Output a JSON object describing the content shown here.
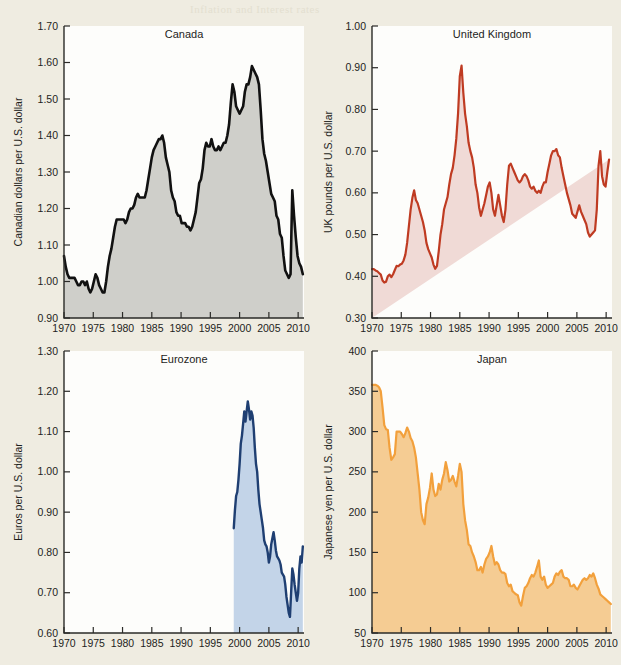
{
  "page": {
    "background_color": "#efece1",
    "bleed_text_top": "Inflation and Interest rates"
  },
  "colors": {
    "canada_line": "#111111",
    "canada_fill": "#cfcfca",
    "uk_line": "#bf3b22",
    "uk_fill": "#f0dad6",
    "eurozone_line": "#1f3f72",
    "eurozone_fill": "#c3d4e8",
    "japan_line": "#f2a03c",
    "japan_fill": "#f5cc93",
    "axis": "#2b2b28",
    "plot_background": "#fdfdfb"
  },
  "chart_data": [
    {
      "type": "area",
      "title": "Canada",
      "xlabel": "",
      "ylabel": "Canadian dollars per U.S. dollar",
      "xlim": [
        1970,
        2011
      ],
      "ylim": [
        0.9,
        1.7
      ],
      "xticks": [
        1970,
        1975,
        1980,
        1985,
        1990,
        1995,
        2000,
        2005,
        2010
      ],
      "yticks": [
        0.9,
        1.0,
        1.1,
        1.2,
        1.3,
        1.4,
        1.5,
        1.6,
        1.7
      ],
      "grid": false,
      "legend": "none",
      "line_color": "#111111",
      "fill_color": "#cfcfca",
      "x": [
        1970.0,
        1970.3,
        1970.6,
        1970.9,
        1971.2,
        1971.5,
        1971.8,
        1972.1,
        1972.4,
        1972.7,
        1973.0,
        1973.3,
        1973.6,
        1973.9,
        1974.2,
        1974.5,
        1974.8,
        1975.1,
        1975.4,
        1975.7,
        1976.0,
        1976.3,
        1976.6,
        1976.9,
        1977.2,
        1977.5,
        1977.8,
        1978.1,
        1978.4,
        1978.7,
        1979.0,
        1979.3,
        1979.6,
        1979.9,
        1980.2,
        1980.5,
        1980.8,
        1981.1,
        1981.4,
        1981.7,
        1982.0,
        1982.3,
        1982.6,
        1982.9,
        1983.2,
        1983.5,
        1983.8,
        1984.1,
        1984.4,
        1984.7,
        1985.0,
        1985.3,
        1985.6,
        1985.9,
        1986.2,
        1986.5,
        1986.8,
        1987.1,
        1987.4,
        1987.7,
        1988.0,
        1988.3,
        1988.6,
        1988.9,
        1989.2,
        1989.5,
        1989.8,
        1990.1,
        1990.4,
        1990.7,
        1991.0,
        1991.3,
        1991.6,
        1991.9,
        1992.2,
        1992.5,
        1992.8,
        1993.1,
        1993.4,
        1993.7,
        1994.0,
        1994.3,
        1994.6,
        1994.9,
        1995.2,
        1995.5,
        1995.8,
        1996.1,
        1996.4,
        1996.7,
        1997.0,
        1997.3,
        1997.6,
        1997.9,
        1998.2,
        1998.5,
        1998.8,
        1999.1,
        1999.4,
        1999.7,
        2000.0,
        2000.3,
        2000.6,
        2000.9,
        2001.2,
        2001.5,
        2001.8,
        2002.1,
        2002.4,
        2002.7,
        2003.0,
        2003.3,
        2003.6,
        2003.9,
        2004.2,
        2004.5,
        2004.8,
        2005.1,
        2005.4,
        2005.7,
        2006.0,
        2006.3,
        2006.6,
        2006.9,
        2007.2,
        2007.5,
        2007.8,
        2008.1,
        2008.4,
        2008.7,
        2009.0,
        2009.3,
        2009.6,
        2009.9,
        2010.2,
        2010.5,
        2010.8
      ],
      "y": [
        1.07,
        1.04,
        1.02,
        1.01,
        1.01,
        1.01,
        1.01,
        1.0,
        0.99,
        0.99,
        1.0,
        1.0,
        0.99,
        1.0,
        0.98,
        0.97,
        0.98,
        1.0,
        1.02,
        1.01,
        0.99,
        0.98,
        0.97,
        0.97,
        1.0,
        1.04,
        1.07,
        1.09,
        1.12,
        1.15,
        1.17,
        1.17,
        1.17,
        1.17,
        1.17,
        1.16,
        1.17,
        1.19,
        1.2,
        1.2,
        1.21,
        1.23,
        1.24,
        1.23,
        1.23,
        1.23,
        1.23,
        1.25,
        1.28,
        1.31,
        1.34,
        1.36,
        1.37,
        1.38,
        1.39,
        1.39,
        1.4,
        1.38,
        1.34,
        1.32,
        1.3,
        1.25,
        1.23,
        1.22,
        1.19,
        1.18,
        1.18,
        1.16,
        1.16,
        1.16,
        1.15,
        1.15,
        1.14,
        1.15,
        1.17,
        1.19,
        1.23,
        1.27,
        1.28,
        1.31,
        1.36,
        1.38,
        1.37,
        1.37,
        1.39,
        1.37,
        1.36,
        1.36,
        1.37,
        1.36,
        1.37,
        1.38,
        1.38,
        1.4,
        1.43,
        1.49,
        1.54,
        1.52,
        1.48,
        1.47,
        1.46,
        1.47,
        1.48,
        1.52,
        1.54,
        1.54,
        1.56,
        1.59,
        1.58,
        1.57,
        1.56,
        1.54,
        1.47,
        1.39,
        1.35,
        1.33,
        1.3,
        1.27,
        1.24,
        1.23,
        1.22,
        1.18,
        1.17,
        1.13,
        1.12,
        1.07,
        1.03,
        1.02,
        1.01,
        1.02,
        1.25,
        1.18,
        1.12,
        1.07,
        1.05,
        1.04,
        1.02
      ]
    },
    {
      "type": "area",
      "title": "United Kingdom",
      "xlabel": "",
      "ylabel": "UK pounds per U.S. dollar",
      "xlim": [
        1970,
        2011
      ],
      "ylim": [
        0.3,
        1.0
      ],
      "xticks": [
        1970,
        1975,
        1980,
        1985,
        1990,
        1995,
        2000,
        2005,
        2010
      ],
      "yticks": [
        0.3,
        0.4,
        0.5,
        0.6,
        0.7,
        0.8,
        0.9,
        1.0
      ],
      "grid": false,
      "legend": "none",
      "line_color": "#bf3b22",
      "fill_color": "#f0dad6",
      "x": [
        1970.0,
        1970.3,
        1970.6,
        1970.9,
        1971.2,
        1971.5,
        1971.8,
        1972.1,
        1972.4,
        1972.7,
        1973.0,
        1973.3,
        1973.6,
        1973.9,
        1974.2,
        1974.5,
        1974.8,
        1975.1,
        1975.4,
        1975.7,
        1976.0,
        1976.3,
        1976.6,
        1976.9,
        1977.2,
        1977.5,
        1977.8,
        1978.1,
        1978.4,
        1978.7,
        1979.0,
        1979.3,
        1979.6,
        1979.9,
        1980.2,
        1980.5,
        1980.8,
        1981.1,
        1981.4,
        1981.7,
        1982.0,
        1982.3,
        1982.6,
        1982.9,
        1983.2,
        1983.5,
        1983.8,
        1984.1,
        1984.4,
        1984.7,
        1985.0,
        1985.3,
        1985.6,
        1985.9,
        1986.2,
        1986.5,
        1986.8,
        1987.1,
        1987.4,
        1987.7,
        1988.0,
        1988.3,
        1988.6,
        1988.9,
        1989.2,
        1989.5,
        1989.8,
        1990.1,
        1990.4,
        1990.7,
        1991.0,
        1991.3,
        1991.6,
        1991.9,
        1992.2,
        1992.5,
        1992.8,
        1993.1,
        1993.4,
        1993.7,
        1994.0,
        1994.3,
        1994.6,
        1994.9,
        1995.2,
        1995.5,
        1995.8,
        1996.1,
        1996.4,
        1996.7,
        1997.0,
        1997.3,
        1997.6,
        1997.9,
        1998.2,
        1998.5,
        1998.8,
        1999.1,
        1999.4,
        1999.7,
        2000.0,
        2000.3,
        2000.6,
        2000.9,
        2001.2,
        2001.5,
        2001.8,
        2002.1,
        2002.4,
        2002.7,
        2003.0,
        2003.3,
        2003.6,
        2003.9,
        2004.2,
        2004.5,
        2004.8,
        2005.1,
        2005.4,
        2005.7,
        2006.0,
        2006.3,
        2006.6,
        2006.9,
        2007.2,
        2007.5,
        2007.8,
        2008.1,
        2008.4,
        2008.7,
        2009.0,
        2009.3,
        2009.6,
        2009.9,
        2010.2,
        2010.5,
        2010.8
      ],
      "y": [
        0.417,
        0.417,
        0.414,
        0.412,
        0.408,
        0.404,
        0.39,
        0.385,
        0.387,
        0.4,
        0.404,
        0.398,
        0.405,
        0.415,
        0.425,
        0.424,
        0.428,
        0.43,
        0.438,
        0.452,
        0.48,
        0.52,
        0.56,
        0.588,
        0.606,
        0.583,
        0.575,
        0.56,
        0.545,
        0.53,
        0.51,
        0.48,
        0.465,
        0.455,
        0.445,
        0.428,
        0.418,
        0.425,
        0.46,
        0.5,
        0.525,
        0.56,
        0.575,
        0.59,
        0.62,
        0.645,
        0.66,
        0.69,
        0.73,
        0.79,
        0.88,
        0.905,
        0.84,
        0.79,
        0.76,
        0.72,
        0.7,
        0.685,
        0.66,
        0.62,
        0.6,
        0.565,
        0.545,
        0.56,
        0.575,
        0.595,
        0.615,
        0.625,
        0.6,
        0.56,
        0.545,
        0.57,
        0.595,
        0.57,
        0.545,
        0.53,
        0.56,
        0.62,
        0.665,
        0.67,
        0.66,
        0.65,
        0.64,
        0.63,
        0.625,
        0.63,
        0.64,
        0.645,
        0.64,
        0.63,
        0.615,
        0.61,
        0.615,
        0.605,
        0.6,
        0.605,
        0.6,
        0.615,
        0.625,
        0.625,
        0.65,
        0.67,
        0.69,
        0.7,
        0.7,
        0.705,
        0.69,
        0.685,
        0.66,
        0.64,
        0.62,
        0.6,
        0.585,
        0.57,
        0.55,
        0.545,
        0.54,
        0.555,
        0.57,
        0.555,
        0.545,
        0.535,
        0.525,
        0.505,
        0.495,
        0.5,
        0.505,
        0.51,
        0.56,
        0.665,
        0.7,
        0.64,
        0.62,
        0.615,
        0.65,
        0.68
      ]
    },
    {
      "type": "area",
      "title": "Eurozone",
      "xlabel": "",
      "ylabel": "Euros per U.S. dollar",
      "xlim": [
        1970,
        2011
      ],
      "ylim": [
        0.6,
        1.3
      ],
      "xticks": [
        1970,
        1975,
        1980,
        1985,
        1990,
        1995,
        2000,
        2005,
        2010
      ],
      "yticks": [
        0.6,
        0.7,
        0.8,
        0.9,
        1.0,
        1.1,
        1.2,
        1.3
      ],
      "grid": false,
      "legend": "none",
      "line_color": "#1f3f72",
      "fill_color": "#c3d4e8",
      "note": "series begins at 1999 (euro introduction)",
      "x": [
        1999.0,
        1999.2,
        1999.4,
        1999.6,
        1999.8,
        2000.0,
        2000.2,
        2000.4,
        2000.6,
        2000.8,
        2001.0,
        2001.2,
        2001.4,
        2001.6,
        2001.8,
        2002.0,
        2002.2,
        2002.4,
        2002.6,
        2002.8,
        2003.0,
        2003.2,
        2003.4,
        2003.6,
        2003.8,
        2004.0,
        2004.2,
        2004.4,
        2004.6,
        2004.8,
        2005.0,
        2005.2,
        2005.4,
        2005.6,
        2005.8,
        2006.0,
        2006.2,
        2006.4,
        2006.6,
        2006.8,
        2007.0,
        2007.2,
        2007.4,
        2007.6,
        2007.8,
        2008.0,
        2008.2,
        2008.4,
        2008.6,
        2008.8,
        2009.0,
        2009.2,
        2009.4,
        2009.6,
        2009.8,
        2010.0,
        2010.2,
        2010.4,
        2010.6,
        2010.8
      ],
      "y": [
        0.86,
        0.905,
        0.94,
        0.95,
        0.98,
        1.02,
        1.07,
        1.09,
        1.12,
        1.15,
        1.125,
        1.15,
        1.175,
        1.155,
        1.13,
        1.15,
        1.14,
        1.11,
        1.06,
        1.02,
        1.0,
        0.955,
        0.92,
        0.9,
        0.88,
        0.86,
        0.83,
        0.82,
        0.815,
        0.8,
        0.775,
        0.79,
        0.82,
        0.835,
        0.85,
        0.83,
        0.805,
        0.79,
        0.785,
        0.78,
        0.77,
        0.75,
        0.745,
        0.74,
        0.72,
        0.69,
        0.67,
        0.65,
        0.64,
        0.7,
        0.76,
        0.745,
        0.72,
        0.7,
        0.68,
        0.7,
        0.76,
        0.79,
        0.775,
        0.815
      ]
    },
    {
      "type": "area",
      "title": "Japan",
      "xlabel": "",
      "ylabel": "Japanese yen per U.S. dollar",
      "xlim": [
        1970,
        2011
      ],
      "ylim": [
        50,
        400
      ],
      "xticks": [
        1970,
        1975,
        1980,
        1985,
        1990,
        1995,
        2000,
        2005,
        2010
      ],
      "yticks": [
        50,
        100,
        150,
        200,
        250,
        300,
        350,
        400
      ],
      "grid": false,
      "legend": "none",
      "line_color": "#f2a03c",
      "fill_color": "#f5cc93",
      "x": [
        1970.0,
        1970.3,
        1970.6,
        1970.9,
        1971.2,
        1971.5,
        1971.8,
        1972.1,
        1972.4,
        1972.7,
        1973.0,
        1973.3,
        1973.6,
        1973.9,
        1974.2,
        1974.5,
        1974.8,
        1975.1,
        1975.4,
        1975.7,
        1976.0,
        1976.3,
        1976.6,
        1976.9,
        1977.2,
        1977.5,
        1977.8,
        1978.1,
        1978.4,
        1978.7,
        1979.0,
        1979.3,
        1979.6,
        1979.9,
        1980.2,
        1980.5,
        1980.8,
        1981.1,
        1981.4,
        1981.7,
        1982.0,
        1982.3,
        1982.6,
        1982.9,
        1983.2,
        1983.5,
        1983.8,
        1984.1,
        1984.4,
        1984.7,
        1985.0,
        1985.3,
        1985.6,
        1985.9,
        1986.2,
        1986.5,
        1986.8,
        1987.1,
        1987.4,
        1987.7,
        1988.0,
        1988.3,
        1988.6,
        1988.9,
        1989.2,
        1989.5,
        1989.8,
        1990.1,
        1990.4,
        1990.7,
        1991.0,
        1991.3,
        1991.6,
        1991.9,
        1992.2,
        1992.5,
        1992.8,
        1993.1,
        1993.4,
        1993.7,
        1994.0,
        1994.3,
        1994.6,
        1994.9,
        1995.2,
        1995.5,
        1995.8,
        1996.1,
        1996.4,
        1996.7,
        1997.0,
        1997.3,
        1997.6,
        1997.9,
        1998.2,
        1998.5,
        1998.8,
        1999.1,
        1999.4,
        1999.7,
        2000.0,
        2000.3,
        2000.6,
        2000.9,
        2001.2,
        2001.5,
        2001.8,
        2002.1,
        2002.4,
        2002.7,
        2003.0,
        2003.3,
        2003.6,
        2003.9,
        2004.2,
        2004.5,
        2004.8,
        2005.1,
        2005.4,
        2005.7,
        2006.0,
        2006.3,
        2006.6,
        2006.9,
        2007.2,
        2007.5,
        2007.8,
        2008.1,
        2008.4,
        2008.7,
        2009.0,
        2009.3,
        2009.6,
        2009.9,
        2010.2,
        2010.5,
        2010.8
      ],
      "y": [
        358,
        358,
        358,
        357,
        355,
        350,
        330,
        308,
        303,
        302,
        280,
        265,
        268,
        272,
        300,
        300,
        300,
        297,
        293,
        298,
        305,
        300,
        292,
        288,
        280,
        268,
        248,
        228,
        200,
        190,
        185,
        210,
        218,
        230,
        248,
        228,
        220,
        222,
        235,
        228,
        240,
        248,
        262,
        252,
        238,
        240,
        245,
        238,
        232,
        245,
        260,
        250,
        210,
        190,
        178,
        160,
        158,
        150,
        145,
        138,
        128,
        128,
        132,
        125,
        135,
        142,
        145,
        150,
        158,
        145,
        135,
        138,
        135,
        128,
        125,
        125,
        123,
        112,
        108,
        110,
        102,
        100,
        98,
        97,
        88,
        84,
        96,
        106,
        108,
        112,
        118,
        122,
        120,
        125,
        132,
        140,
        120,
        116,
        120,
        110,
        106,
        108,
        110,
        112,
        120,
        124,
        122,
        126,
        128,
        120,
        118,
        118,
        116,
        108,
        108,
        110,
        106,
        104,
        108,
        112,
        116,
        118,
        116,
        118,
        122,
        120,
        124,
        118,
        110,
        105,
        98,
        96,
        94,
        92,
        90,
        88,
        86
      ]
    }
  ]
}
